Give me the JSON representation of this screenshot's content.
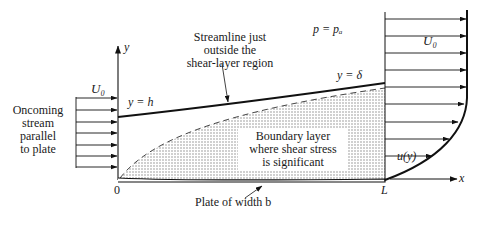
{
  "diagram": {
    "labels": {
      "y_axis": "y",
      "x_axis": "x",
      "origin": "0",
      "plate_end": "L",
      "inlet_velocity": "U₀",
      "outlet_velocity": "U₀",
      "streamline_height": "y = h",
      "bl_thickness": "y = δ",
      "pressure": "p = pₐ",
      "profile": "u(y)",
      "oncoming_stream": [
        "Oncoming",
        "stream",
        "parallel",
        "to plate"
      ],
      "streamline_note": [
        "Streamline just",
        "outside the",
        "shear-layer region"
      ],
      "boundary_layer_note": [
        "Boundary layer",
        "where shear stress",
        "is significant"
      ],
      "plate_note": "Plate of width b"
    },
    "inlet_arrow_count": 7,
    "outlet_arrow_count": 10,
    "colors": {
      "line": "#111111",
      "shading": "#bdbdbd",
      "background": "#ffffff"
    }
  }
}
